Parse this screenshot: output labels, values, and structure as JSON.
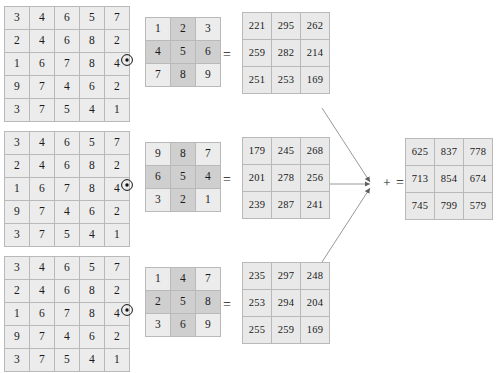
{
  "diagram": {
    "operator_conv": "⊙",
    "operator_equals": "=",
    "operator_plus": "+",
    "operator_final_equals": "=",
    "colors": {
      "cell_background": "#ececec",
      "cell_highlight": "#cfcfcf",
      "grid_line": "#b9b9b9",
      "text": "#1a1a1a",
      "arrow": "#6a6a6a"
    }
  },
  "input_matrix": {
    "rows": 5,
    "cols": 5,
    "values": [
      [
        3,
        4,
        6,
        5,
        7
      ],
      [
        2,
        4,
        6,
        8,
        2
      ],
      [
        1,
        6,
        7,
        8,
        4
      ],
      [
        9,
        7,
        4,
        6,
        2
      ],
      [
        3,
        7,
        5,
        4,
        1
      ]
    ]
  },
  "branches": [
    {
      "kernel": {
        "rows": 3,
        "cols": 3,
        "values": [
          [
            1,
            2,
            3
          ],
          [
            4,
            5,
            6
          ],
          [
            7,
            8,
            9
          ]
        ],
        "highlight": [
          [
            false,
            true,
            false
          ],
          [
            true,
            true,
            true
          ],
          [
            false,
            true,
            false
          ]
        ]
      },
      "result": {
        "rows": 3,
        "cols": 3,
        "values": [
          [
            221,
            295,
            262
          ],
          [
            259,
            282,
            214
          ],
          [
            251,
            253,
            169
          ]
        ]
      }
    },
    {
      "kernel": {
        "rows": 3,
        "cols": 3,
        "values": [
          [
            9,
            8,
            7
          ],
          [
            6,
            5,
            4
          ],
          [
            3,
            2,
            1
          ]
        ],
        "highlight": [
          [
            false,
            true,
            false
          ],
          [
            true,
            true,
            true
          ],
          [
            false,
            true,
            false
          ]
        ]
      },
      "result": {
        "rows": 3,
        "cols": 3,
        "values": [
          [
            179,
            245,
            268
          ],
          [
            201,
            278,
            256
          ],
          [
            239,
            287,
            241
          ]
        ]
      }
    },
    {
      "kernel": {
        "rows": 3,
        "cols": 3,
        "values": [
          [
            1,
            4,
            7
          ],
          [
            2,
            5,
            8
          ],
          [
            3,
            6,
            9
          ]
        ],
        "highlight": [
          [
            false,
            true,
            false
          ],
          [
            true,
            true,
            true
          ],
          [
            false,
            true,
            false
          ]
        ]
      },
      "result": {
        "rows": 3,
        "cols": 3,
        "values": [
          [
            235,
            297,
            248
          ],
          [
            253,
            294,
            204
          ],
          [
            255,
            259,
            169
          ]
        ]
      }
    }
  ],
  "final_matrix": {
    "rows": 3,
    "cols": 3,
    "values": [
      [
        625,
        837,
        778
      ],
      [
        713,
        854,
        674
      ],
      [
        745,
        799,
        579
      ]
    ]
  }
}
